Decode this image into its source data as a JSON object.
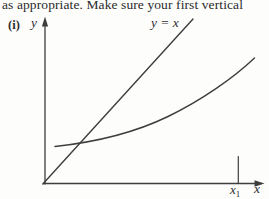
{
  "page": {
    "top_text": "as appropriate. Make sure your first vertical"
  },
  "figure": {
    "part_label": "(i)",
    "y_axis_label": "y",
    "x_axis_label": "x",
    "line_label": "y = x",
    "x1_label": {
      "base": "x",
      "sub": "1"
    }
  },
  "colors": {
    "ink": "#2a2a2a",
    "stroke": "#3e3e3e"
  }
}
